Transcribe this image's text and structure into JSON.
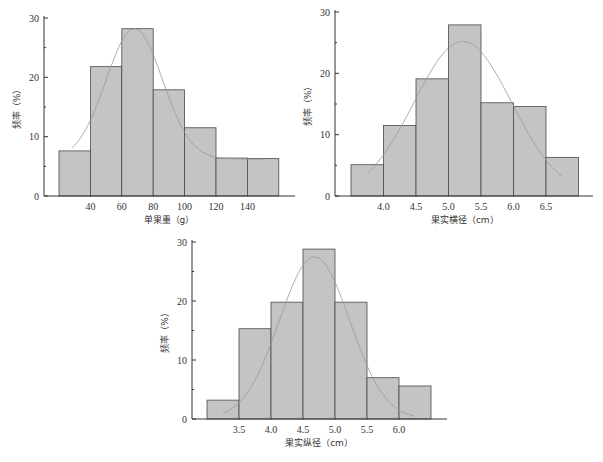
{
  "chart_data": [
    {
      "type": "bar",
      "id": "weight",
      "title": "",
      "xlabel": "单果重（g）",
      "ylabel": "频率（%）",
      "bin_edges": [
        20,
        40,
        60,
        80,
        100,
        120,
        140,
        160
      ],
      "values": [
        7.6,
        21.8,
        28.2,
        17.9,
        11.5,
        6.4,
        6.3
      ],
      "x_ticks": [
        40,
        60,
        80,
        100,
        120,
        140
      ],
      "x_tick_labels": [
        "40",
        "60",
        "80",
        "100",
        "120",
        "140"
      ],
      "y_ticks": [
        0,
        10,
        20,
        30
      ],
      "y_tick_labels": [
        "0",
        "10",
        "20",
        "30"
      ],
      "ylim": [
        0,
        30
      ],
      "xlim": [
        8,
        170
      ],
      "fit_curve": {
        "type": "normal",
        "x_range": [
          28,
          150
        ],
        "mean": 68,
        "peak": 28.2,
        "sd": 18,
        "baseline": 6.2
      }
    },
    {
      "type": "bar",
      "id": "transverse",
      "title": "",
      "xlabel": "果实横径（cm）",
      "ylabel": "频率（%）",
      "bin_edges": [
        3.5,
        4.0,
        4.5,
        5.0,
        5.5,
        6.0,
        6.5,
        7.0
      ],
      "values": [
        5.1,
        11.5,
        19.1,
        27.9,
        15.2,
        14.6,
        6.3
      ],
      "x_ticks": [
        4.0,
        4.5,
        5.0,
        5.5,
        6.0,
        6.5
      ],
      "x_tick_labels": [
        "4.0",
        "4.5",
        "5.0",
        "5.5",
        "6.0",
        "6.5"
      ],
      "y_ticks": [
        0,
        10,
        20,
        30
      ],
      "y_tick_labels": [
        "0",
        "10",
        "20",
        "30"
      ],
      "ylim": [
        0,
        30
      ],
      "xlim": [
        3.25,
        7.25
      ],
      "fit_curve": {
        "type": "normal",
        "x_range": [
          3.75,
          6.75
        ],
        "mean": 5.22,
        "peak": 25.2,
        "sd": 0.75,
        "baseline": 0
      }
    },
    {
      "type": "bar",
      "id": "longitudinal",
      "title": "",
      "xlabel": "果实纵径（cm）",
      "ylabel": "频率（%）",
      "bin_edges": [
        3.0,
        3.5,
        4.0,
        4.5,
        5.0,
        5.5,
        6.0,
        6.5
      ],
      "values": [
        3.2,
        15.3,
        19.8,
        28.8,
        19.8,
        7.0,
        5.6
      ],
      "x_ticks": [
        3.5,
        4.0,
        4.5,
        5.0,
        5.5,
        6.0
      ],
      "x_tick_labels": [
        "3.5",
        "4.0",
        "4.5",
        "5.0",
        "5.5",
        "6.0"
      ],
      "y_ticks": [
        0,
        10,
        20,
        30
      ],
      "y_tick_labels": [
        "0",
        "10",
        "20",
        "30"
      ],
      "ylim": [
        0,
        30
      ],
      "xlim": [
        2.62,
        6.75
      ],
      "fit_curve": {
        "type": "normal",
        "x_range": [
          3.25,
          6.25
        ],
        "mean": 4.68,
        "peak": 27.5,
        "sd": 0.55,
        "baseline": 0
      }
    }
  ]
}
